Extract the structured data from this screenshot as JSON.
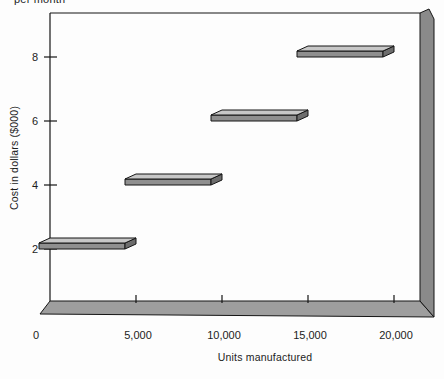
{
  "chart_data": {
    "type": "step",
    "note": "per month",
    "ylabel": "Cost in dollars ($000)",
    "xlabel": "Units manufactured",
    "y_ticks": [
      {
        "value": 2,
        "label": "2"
      },
      {
        "value": 4,
        "label": "4"
      },
      {
        "value": 6,
        "label": "6"
      },
      {
        "value": 8,
        "label": "8"
      }
    ],
    "x_ticks": [
      {
        "value": 0,
        "label": "0"
      },
      {
        "value": 5000,
        "label": "5,000"
      },
      {
        "value": 10000,
        "label": "10,000"
      },
      {
        "value": 15000,
        "label": "15,000"
      },
      {
        "value": 20000,
        "label": "20,000"
      }
    ],
    "xlim": [
      0,
      20000
    ],
    "ylim": [
      0,
      9.4
    ],
    "grid": false,
    "legend": "none",
    "steps": [
      {
        "units_from": 0,
        "units_to": 5000,
        "cost_thousands": 2
      },
      {
        "units_from": 5000,
        "units_to": 10000,
        "cost_thousands": 4
      },
      {
        "units_from": 10000,
        "units_to": 15000,
        "cost_thousands": 6
      },
      {
        "units_from": 15000,
        "units_to": 20000,
        "cost_thousands": 8
      }
    ],
    "colors": {
      "slab_top": "#c7c7c7",
      "slab_front": "#8f8f8f",
      "slab_end": "#6d6d6d",
      "wall": "#8a8a8a",
      "base": "#9e9e9e",
      "outline": "#151515",
      "text": "#1c1c1c"
    }
  }
}
